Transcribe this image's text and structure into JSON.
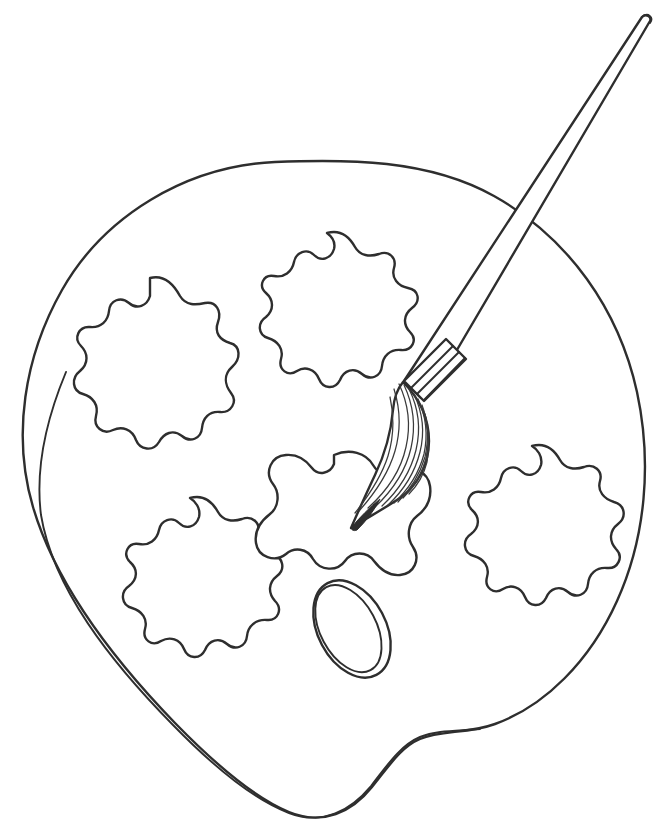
{
  "canvas": {
    "width": 662,
    "height": 837,
    "background_color": "#ffffff",
    "line_color": "#2e2e2e",
    "style": "black-and-white line art / coloring page",
    "title": "Artist palette with paintbrush"
  },
  "scene": {
    "name": "artist-palette-coloring-page",
    "description": "Outline drawing of a kidney-shaped artist's paint palette with five blob-shaped paint wells, an oval thumb hole, and a paintbrush resting tip-down on the center well.",
    "object_count": 3
  },
  "objects": [
    {
      "id": "palette",
      "label": "Artist palette",
      "shape": "rounded kidney / apple outline with notched lower edge",
      "outline_style": "double line along left and bottom rim, single line along top and right rim",
      "fill": "none"
    },
    {
      "id": "paint-wells",
      "label": "Paint wells",
      "count": 5,
      "shape": "irregular wavy blobs",
      "positions": [
        "upper-left",
        "upper-right",
        "lower-left",
        "center",
        "right"
      ]
    },
    {
      "id": "thumb-hole",
      "label": "Thumb hole",
      "shape": "tilted oval with double outline",
      "tilt_degrees": -28
    },
    {
      "id": "paintbrush",
      "label": "Paintbrush",
      "parts": [
        "handle",
        "ferrule",
        "bristles",
        "tip"
      ],
      "ferrule_band_count": 3,
      "angle_degrees": -52,
      "orientation": "tip at lower-left touching center paint well, handle extends to upper-right corner"
    }
  ],
  "paint_wells": [
    {
      "id": "well-upper-left",
      "label": "Upper left paint well",
      "cx": 152,
      "cy": 342,
      "rx": 66,
      "ry": 66,
      "lobes": 9
    },
    {
      "id": "well-upper-right",
      "label": "Upper right paint well",
      "cx": 327,
      "cy": 295,
      "rx": 64,
      "ry": 62,
      "lobes": 11
    },
    {
      "id": "well-lower-left",
      "label": "Lower left paint well",
      "cx": 188,
      "cy": 564,
      "rx": 68,
      "ry": 66,
      "lobes": 11
    },
    {
      "id": "well-center",
      "label": "Center paint well",
      "cx": 339,
      "cy": 507,
      "rx": 58,
      "ry": 52,
      "lobes": 6
    },
    {
      "id": "well-right",
      "label": "Right paint well",
      "cx": 533,
      "cy": 512,
      "rx": 62,
      "ry": 66,
      "lobes": 10
    }
  ],
  "thumb_hole": {
    "cx": 352,
    "cy": 629,
    "rx": 32,
    "ry": 50,
    "rotation": -28
  },
  "paintbrush": {
    "tip_point": {
      "x": 349,
      "y": 529
    },
    "ferrule_mid": {
      "x": 434,
      "y": 384
    },
    "handle_end": {
      "x": 645,
      "y": 25
    },
    "bristle_line_count": 10,
    "band_count": 3
  },
  "alt_text": "Coloring-page style outline of an artist's paint palette holding five blob-shaped paint wells and an oval thumb hole, with a paintbrush angled from the upper right down to the center well."
}
